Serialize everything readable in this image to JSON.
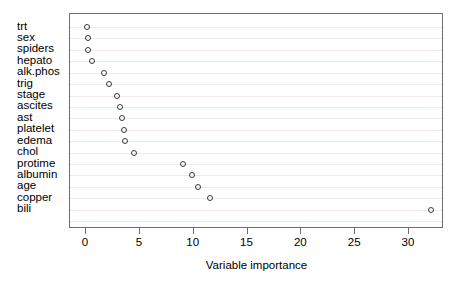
{
  "chart_data": {
    "type": "scatter",
    "title": "",
    "subtitle": "",
    "xlabel": "Variable importance",
    "ylabel": "",
    "xlim": [
      -0.9,
      33.8
    ],
    "ylim": [
      0,
      17
    ],
    "grid": "horizontal",
    "legend": "none",
    "orientation": "dotplot-horizontal",
    "xticks": [
      0,
      5,
      10,
      15,
      20,
      25,
      30
    ],
    "xticklabels": [
      "0",
      "5",
      "10",
      "15",
      "20",
      "25",
      "30"
    ],
    "categories": [
      "trt",
      "sex",
      "spiders",
      "hepato",
      "alk.phos",
      "trig",
      "stage",
      "ascites",
      "ast",
      "platelet",
      "edema",
      "chol",
      "protime",
      "albumin",
      "age",
      "copper",
      "bili"
    ],
    "values": [
      0.1,
      0.15,
      0.2,
      0.6,
      1.7,
      2.1,
      2.9,
      3.2,
      3.3,
      3.5,
      3.6,
      4.5,
      9.0,
      9.8,
      10.4,
      11.5,
      32.0
    ],
    "point_marker": "open-circle",
    "point_color": "#3a3a3a",
    "gridline_color": "#f2e9ec",
    "frame_color": "#6e6e6e",
    "background_color": "#ffffff"
  }
}
